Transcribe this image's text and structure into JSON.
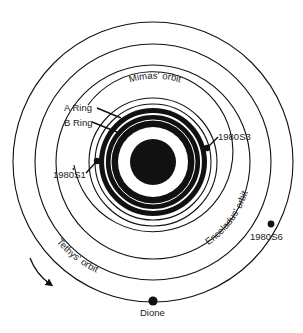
{
  "diagram": {
    "colors": {
      "ink": "#111111",
      "paper": "#ffffff"
    },
    "labels": {
      "a_ring": "A Ring",
      "b_ring": "B Ring",
      "mimas_orbit": "Mimas' orbit",
      "enceladus_orbit": "Enceladus' orbit",
      "tethys_orbit": "Tethys' orbit",
      "s3": "1980S3",
      "s1": "1980S1",
      "s6": "1980S6",
      "dione": "Dione"
    },
    "orbits": [
      {
        "name": "1980S3 orbit",
        "radius": 58
      },
      {
        "name": "1980S1 orbit",
        "radius": 64
      },
      {
        "name": "Mimas' orbit",
        "radius": 80
      },
      {
        "name": "Enceladus' orbit",
        "radius": 98
      },
      {
        "name": "Tethys' orbit",
        "radius": 118
      },
      {
        "name": "Dione orbit",
        "radius": 140
      }
    ],
    "moons": [
      {
        "name": "1980S3",
        "x": 207,
        "y": 148
      },
      {
        "name": "1980S1",
        "x": 97,
        "y": 161
      },
      {
        "name": "1980S6",
        "x": 271,
        "y": 224
      },
      {
        "name": "Dione",
        "x": 153,
        "y": 301
      }
    ],
    "rotation_arrow": "clockwise"
  }
}
